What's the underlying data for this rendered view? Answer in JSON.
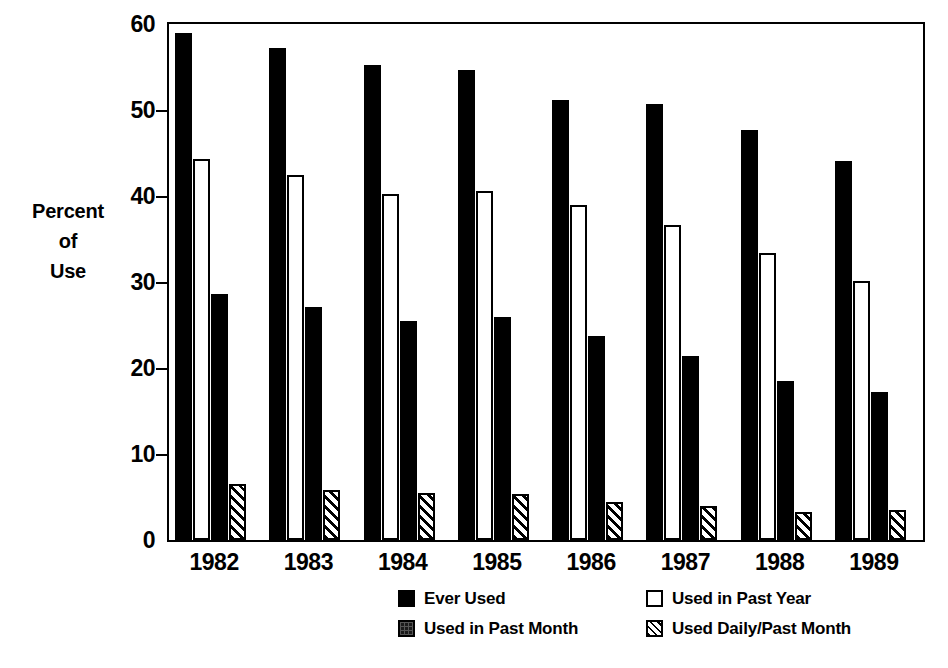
{
  "chart_data": {
    "type": "bar",
    "title": "",
    "subtitle": "",
    "xlabel": "",
    "ylabel": "Percent of Use",
    "ylabel_lines": [
      "Percent",
      "of",
      "Use"
    ],
    "ylim": [
      0,
      60
    ],
    "yticks": [
      0,
      10,
      20,
      30,
      40,
      50,
      60
    ],
    "ytick_labels": [
      "0",
      "10",
      "20",
      "30",
      "40",
      "50",
      "60"
    ],
    "grid": false,
    "legend_position": "bottom",
    "categories": [
      "1982",
      "1983",
      "1984",
      "1985",
      "1986",
      "1987",
      "1988",
      "1989"
    ],
    "series": [
      {
        "name": "Ever Used",
        "style": "solid-black",
        "color": "#000000",
        "values": [
          58.9,
          57.2,
          55.2,
          54.6,
          51.2,
          50.7,
          47.7,
          44.1
        ]
      },
      {
        "name": "Used in Past Year",
        "style": "open-white",
        "color": "#ffffff",
        "values": [
          44.3,
          42.5,
          40.2,
          40.6,
          38.9,
          36.6,
          33.4,
          30.1
        ]
      },
      {
        "name": "Used in Past Month",
        "style": "solid-black",
        "color": "#000000",
        "values": [
          28.6,
          27.1,
          25.5,
          25.9,
          23.7,
          21.4,
          18.5,
          17.2
        ]
      },
      {
        "name": "Used Daily/Past Month",
        "style": "diagonal-hatch",
        "color": "#ffffff",
        "values": [
          6.5,
          5.8,
          5.5,
          5.3,
          4.4,
          3.9,
          3.2,
          3.5
        ]
      }
    ]
  },
  "legend": {
    "items": [
      {
        "label": "Ever Used",
        "swatch": "solid"
      },
      {
        "label": "Used in Past Month",
        "swatch": "dark"
      },
      {
        "label": "Used in Past Year",
        "swatch": "open"
      },
      {
        "label": "Used Daily/Past Month",
        "swatch": "hatch"
      }
    ]
  }
}
